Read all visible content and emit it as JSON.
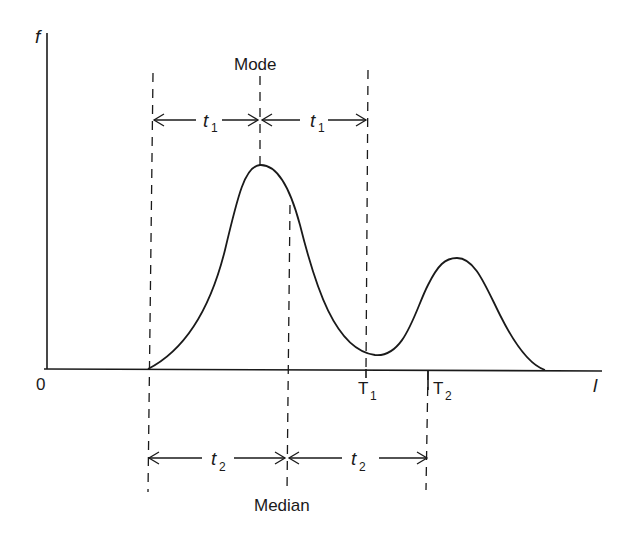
{
  "diagram": {
    "axes": {
      "y_label": "f",
      "x_label": "l",
      "origin_label": "0"
    },
    "markers": {
      "mode_label": "Mode",
      "median_label": "Median",
      "T1": {
        "main": "T",
        "sub": "1"
      },
      "T2": {
        "main": "T",
        "sub": "2"
      }
    },
    "intervals": {
      "t1_left": {
        "main": "t",
        "sub": "1"
      },
      "t1_right": {
        "main": "t",
        "sub": "1"
      },
      "t2_left": {
        "main": "t",
        "sub": "2"
      },
      "t2_right": {
        "main": "t",
        "sub": "2"
      }
    },
    "colors": {
      "ink": "#1a1a1a",
      "background": "#ffffff"
    }
  }
}
